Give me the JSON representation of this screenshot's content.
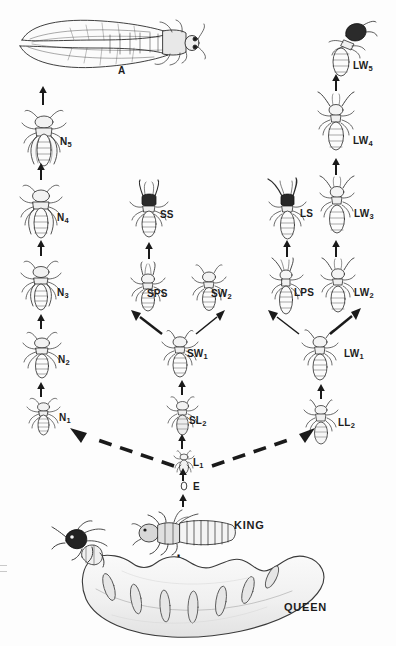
{
  "figure": {
    "background_color": "#fdfdfd",
    "ink_color": "#1a1a1a",
    "width": 396,
    "height": 646
  },
  "castes": [
    {
      "id": "A",
      "label": "A",
      "sub": "",
      "x": 120,
      "y": 72,
      "name": "alate-adult"
    },
    {
      "id": "N5",
      "label": "N",
      "sub": "5",
      "x": 63,
      "y": 143,
      "name": "nymph-5"
    },
    {
      "id": "N4",
      "label": "N",
      "sub": "4",
      "x": 60,
      "y": 219,
      "name": "nymph-4"
    },
    {
      "id": "N3",
      "label": "N",
      "sub": "3",
      "x": 60,
      "y": 294,
      "name": "nymph-3"
    },
    {
      "id": "N2",
      "label": "N",
      "sub": "2",
      "x": 61,
      "y": 361,
      "name": "nymph-2"
    },
    {
      "id": "N1",
      "label": "N",
      "sub": "1",
      "x": 62,
      "y": 419,
      "name": "nymph-1"
    },
    {
      "id": "SS",
      "label": "SS",
      "sub": "",
      "x": 164,
      "y": 216,
      "name": "short-soldier"
    },
    {
      "id": "SPS",
      "label": "SPS",
      "sub": "",
      "x": 152,
      "y": 295,
      "name": "short-presoldier"
    },
    {
      "id": "SW2",
      "label": "SW",
      "sub": "2",
      "x": 215,
      "y": 295,
      "name": "short-worker-2"
    },
    {
      "id": "SW1",
      "label": "SW",
      "sub": "1",
      "x": 191,
      "y": 355,
      "name": "short-worker-1"
    },
    {
      "id": "SL2",
      "label": "SL",
      "sub": "2",
      "x": 193,
      "y": 422,
      "name": "short-larva-2"
    },
    {
      "id": "L1",
      "label": "L",
      "sub": "1",
      "x": 196,
      "y": 463,
      "name": "larva-1"
    },
    {
      "id": "E",
      "label": "E",
      "sub": "",
      "x": 196,
      "y": 487,
      "name": "egg"
    },
    {
      "id": "LS",
      "label": "LS",
      "sub": "",
      "x": 304,
      "y": 215,
      "name": "long-soldier"
    },
    {
      "id": "LPS",
      "label": "LPS",
      "sub": "",
      "x": 299,
      "y": 294,
      "name": "long-presoldier"
    },
    {
      "id": "LW5",
      "label": "LW",
      "sub": "5",
      "x": 357,
      "y": 67,
      "name": "long-worker-5"
    },
    {
      "id": "LW4",
      "label": "LW",
      "sub": "4",
      "x": 357,
      "y": 142,
      "name": "long-worker-4"
    },
    {
      "id": "LW3",
      "label": "LW",
      "sub": "3",
      "x": 359,
      "y": 215,
      "name": "long-worker-3"
    },
    {
      "id": "LW2",
      "label": "LW",
      "sub": "2",
      "x": 359,
      "y": 294,
      "name": "long-worker-2"
    },
    {
      "id": "LW1",
      "label": "LW",
      "sub": "1",
      "x": 348,
      "y": 355,
      "name": "long-worker-1"
    },
    {
      "id": "LL2",
      "label": "LL",
      "sub": "2",
      "x": 342,
      "y": 424,
      "name": "long-larva-2"
    },
    {
      "id": "KING",
      "label": "KING",
      "sub": "",
      "x": 238,
      "y": 526,
      "name": "king"
    },
    {
      "id": "QUEEN",
      "label": "QUEEN",
      "sub": "",
      "x": 288,
      "y": 608,
      "name": "queen"
    }
  ],
  "symbols": {
    "plus": "+"
  },
  "arrows": {
    "solid_count": 16,
    "dashed_count": 2,
    "description": "solid upward arrows between consecutive stages; dashed arrows from L1 to N1 and LL2"
  }
}
